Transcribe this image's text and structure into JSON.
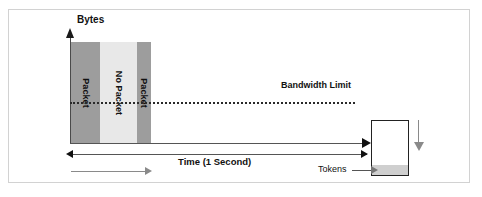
{
  "figure": {
    "background_color": "#ffffff",
    "frame_color": "#d2d2d2"
  },
  "axes": {
    "y_label": "Bytes",
    "x_label": "Time (1 Second)",
    "y_arrow_icon": "arrow-up-icon",
    "x_arrow_icon": "arrow-right-icon"
  },
  "annotations": {
    "bandwidth_limit": "Bandwidth Limit",
    "tokens": "Tokens",
    "limit_line_style": "dotted",
    "limit_line_color": "#2a2a2a"
  },
  "bucket": {
    "label": "Tokens",
    "border_color": "#222222",
    "fill_color": "#cfcfcf",
    "refill_arrow_icon": "arrow-down-icon",
    "refill_arrow_color": "#8a8a8a"
  },
  "flow": {
    "arrow_icon": "arrow-right-icon",
    "arrow_color": "#8a8a8a"
  },
  "chart_data": {
    "type": "bar",
    "xlabel": "Time (1 Second)",
    "ylabel": "Bytes",
    "grid": false,
    "legend": "none",
    "categories": [
      "Packet",
      "No Packet",
      "Packet"
    ],
    "values": [
      100,
      100,
      100
    ],
    "bar_colors": [
      "#9d9d9d",
      "#e8e8e8",
      "#9d9d9d"
    ],
    "bar_widths": [
      29,
      37,
      14
    ],
    "annotations": [
      {
        "label": "Bandwidth Limit",
        "type": "hline",
        "value": 40,
        "style": "dotted"
      },
      {
        "label": "Tokens",
        "type": "callout",
        "target": "token-bucket"
      }
    ],
    "ylim": [
      0,
      100
    ],
    "xlim": [
      0,
      1
    ]
  },
  "bars": [
    {
      "label": "Packet",
      "color": "#9d9d9d"
    },
    {
      "label": "No Packet",
      "color": "#e8e8e8"
    },
    {
      "label": "Packet",
      "color": "#9d9d9d"
    }
  ]
}
